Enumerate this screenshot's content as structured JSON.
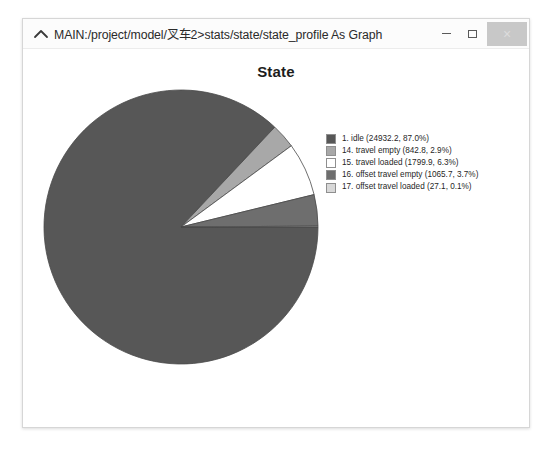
{
  "window": {
    "title": "MAIN:/project/model/叉车2>stats/state/state_profile As Graph",
    "icon": "chevron-up-icon",
    "minimize_label": "",
    "maximize_label": "",
    "close_label": "×"
  },
  "chart_data": {
    "type": "pie",
    "title": "State",
    "xlabel": "",
    "ylabel": "",
    "legend_position": "right",
    "grid": false,
    "categories": [
      "1. idle",
      "14. travel empty",
      "15. travel loaded",
      "16. offset travel empty",
      "17. offset travel loaded"
    ],
    "values": [
      24932.2,
      842.8,
      1799.9,
      1065.7,
      27.1
    ],
    "percentages": [
      87.0,
      2.9,
      6.3,
      3.7,
      0.1
    ],
    "colors": [
      "#575757",
      "#a8a8a8",
      "#ffffff",
      "#6e6e6e",
      "#d8d8d8"
    ],
    "legend_entries": [
      "1. idle (24932.2, 87.0%)",
      "14. travel empty (842.8, 2.9%)",
      "15. travel loaded (1799.9, 6.3%)",
      "16. offset travel empty (1065.7, 3.7%)",
      "17. offset travel loaded (27.1, 0.1%)"
    ]
  }
}
